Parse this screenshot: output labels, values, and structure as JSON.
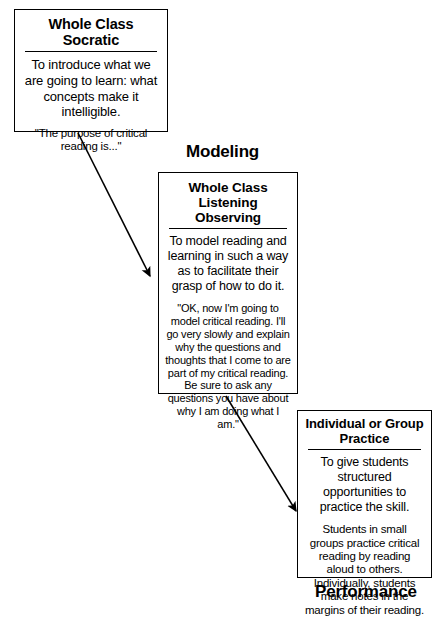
{
  "diagram": {
    "background_color": "#ffffff",
    "line_color": "#000000",
    "boxes": [
      {
        "id": "socratic",
        "title": "Whole Class Socratic",
        "purpose": "To introduce what we are going to learn: what concepts make it intelligible.",
        "quote": "\"The purpose of critical reading is...\""
      },
      {
        "id": "listening",
        "title_line1": "Whole Class",
        "title_line2": "Listening Observing",
        "purpose": "To model reading and learning in such a way as to facilitate their grasp of how to do it.",
        "quote": "\"OK, now I'm going to model critical reading. I'll go very slowly and explain why the questions and thoughts that I come to are part of my critical reading. Be sure to ask any questions you have about why I am doing what I am.\""
      },
      {
        "id": "practice",
        "title_line1": "Individual or Group",
        "title_line2": "Practice",
        "purpose": "To give students structured opportunities to practice the skill.",
        "quote": "Students in small groups practice critical reading by reading aloud to others. Individually, students make notes in the margins of their reading."
      }
    ],
    "captions": {
      "modeling": "Modeling",
      "performance": "Performance"
    },
    "arrows": [
      {
        "id": "socratic-to-listening",
        "from": "socratic",
        "to": "listening"
      },
      {
        "id": "listening-to-practice",
        "from": "listening",
        "to": "practice"
      }
    ]
  }
}
